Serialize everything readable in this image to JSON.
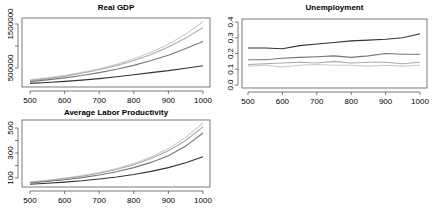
{
  "chart_data": [
    {
      "type": "line",
      "title": "Real GDP",
      "xlabel": "",
      "ylabel": "",
      "xlim": [
        500,
        1000
      ],
      "ylim": [
        100000,
        1650000
      ],
      "x_ticks": [
        500,
        600,
        700,
        800,
        900,
        1000
      ],
      "y_ticks": [
        500000,
        1000000,
        1500000
      ],
      "y_tick_labels": [
        "500000",
        "",
        "1500000"
      ],
      "x": [
        500,
        550,
        600,
        650,
        700,
        750,
        800,
        850,
        900,
        950,
        1000
      ],
      "series": [
        {
          "name": "series-1",
          "color": "#333333",
          "values": [
            150000,
            170000,
            195000,
            225000,
            260000,
            300000,
            345000,
            395000,
            440000,
            495000,
            550000
          ]
        },
        {
          "name": "series-2",
          "color": "#777777",
          "values": [
            190000,
            230000,
            275000,
            330000,
            395000,
            470000,
            560000,
            670000,
            790000,
            940000,
            1100000
          ]
        },
        {
          "name": "series-3",
          "color": "#aaaaaa",
          "values": [
            215000,
            260000,
            315000,
            380000,
            460000,
            555000,
            670000,
            810000,
            975000,
            1180000,
            1420000
          ]
        },
        {
          "name": "series-4",
          "color": "#cccccc",
          "values": [
            230000,
            275000,
            330000,
            400000,
            485000,
            585000,
            710000,
            860000,
            1040000,
            1270000,
            1550000
          ]
        }
      ],
      "grid": false,
      "legend": "none"
    },
    {
      "type": "line",
      "title": "Unemployment",
      "xlabel": "",
      "ylabel": "",
      "xlim": [
        500,
        1000
      ],
      "ylim": [
        0.0,
        0.4
      ],
      "x_ticks": [
        500,
        600,
        700,
        800,
        900,
        1000
      ],
      "y_ticks": [
        0.0,
        0.1,
        0.2,
        0.3,
        0.4
      ],
      "y_tick_labels": [
        "0.0",
        "0.1",
        "0.2",
        "0.3",
        "0.4"
      ],
      "x": [
        500,
        550,
        600,
        650,
        700,
        750,
        800,
        850,
        900,
        950,
        1000
      ],
      "series": [
        {
          "name": "series-1",
          "color": "#333333",
          "values": [
            0.235,
            0.235,
            0.23,
            0.25,
            0.26,
            0.27,
            0.28,
            0.285,
            0.29,
            0.3,
            0.325
          ]
        },
        {
          "name": "series-2",
          "color": "#777777",
          "values": [
            0.16,
            0.16,
            0.17,
            0.175,
            0.18,
            0.185,
            0.175,
            0.185,
            0.2,
            0.195,
            0.195
          ]
        },
        {
          "name": "series-3",
          "color": "#aaaaaa",
          "values": [
            0.13,
            0.135,
            0.14,
            0.145,
            0.14,
            0.15,
            0.14,
            0.145,
            0.145,
            0.135,
            0.145
          ]
        },
        {
          "name": "series-4",
          "color": "#cccccc",
          "values": [
            0.12,
            0.125,
            0.115,
            0.125,
            0.13,
            0.125,
            0.125,
            0.12,
            0.125,
            0.12,
            0.125
          ]
        }
      ],
      "grid": false,
      "legend": "none"
    },
    {
      "type": "line",
      "title": "Average Labor Productivity",
      "xlabel": "",
      "ylabel": "",
      "xlim": [
        500,
        1000
      ],
      "ylim": [
        30,
        570
      ],
      "x_ticks": [
        500,
        600,
        700,
        800,
        900,
        1000
      ],
      "y_ticks": [
        100,
        200,
        300,
        400,
        500
      ],
      "y_tick_labels": [
        "100",
        "",
        "300",
        "",
        "500"
      ],
      "x": [
        500,
        550,
        600,
        650,
        700,
        750,
        800,
        850,
        900,
        950,
        1000
      ],
      "series": [
        {
          "name": "series-1",
          "color": "#333333",
          "values": [
            50,
            58,
            67,
            78,
            92,
            108,
            128,
            153,
            183,
            222,
            270
          ]
        },
        {
          "name": "series-2",
          "color": "#777777",
          "values": [
            60,
            72,
            86,
            103,
            124,
            150,
            183,
            225,
            278,
            355,
            460
          ]
        },
        {
          "name": "series-3",
          "color": "#aaaaaa",
          "values": [
            65,
            79,
            95,
            114,
            138,
            168,
            206,
            255,
            318,
            400,
            510
          ]
        },
        {
          "name": "series-4",
          "color": "#cccccc",
          "values": [
            68,
            82,
            99,
            119,
            144,
            176,
            216,
            268,
            335,
            425,
            540
          ]
        }
      ],
      "grid": false,
      "legend": "none"
    }
  ]
}
